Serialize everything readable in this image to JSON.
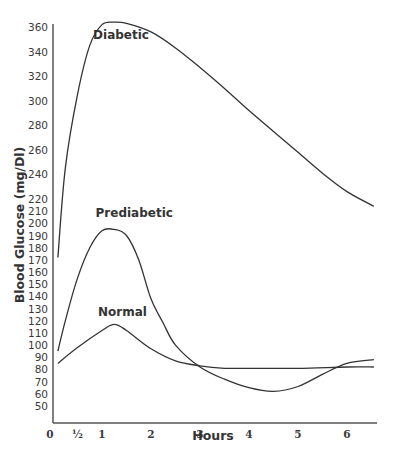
{
  "chart_data": {
    "type": "line",
    "title": "",
    "xlabel": "Hours",
    "ylabel": "Blood Glucose (mg/Dl)",
    "x_ticks": [
      "0",
      "½",
      "1",
      "2",
      "3",
      "4",
      "5",
      "6"
    ],
    "x_tick_values": [
      0,
      0.5,
      1,
      2,
      3,
      4,
      5,
      6
    ],
    "y_ticks": [
      360,
      340,
      320,
      300,
      280,
      260,
      240,
      220,
      210,
      200,
      190,
      180,
      170,
      160,
      150,
      140,
      130,
      120,
      110,
      100,
      90,
      80,
      70,
      60,
      50
    ],
    "xlim": [
      0,
      6.6
    ],
    "ylim": [
      50,
      365
    ],
    "grid": false,
    "legend": "inline labels",
    "series": [
      {
        "name": "Diabetic",
        "label_pos": {
          "x": 0.9,
          "y": 350
        },
        "x": [
          0.1,
          0.25,
          0.5,
          0.75,
          1.0,
          1.25,
          1.5,
          2.0,
          2.5,
          3.0,
          3.5,
          4.0,
          4.5,
          5.0,
          5.5,
          6.0,
          6.55
        ],
        "values": [
          172,
          245,
          305,
          345,
          362,
          364,
          363,
          356,
          343,
          327,
          310,
          292,
          275,
          258,
          241,
          226,
          214
        ]
      },
      {
        "name": "Prediabetic",
        "label_pos": {
          "x": 0.95,
          "y": 205
        },
        "x": [
          0.1,
          0.25,
          0.5,
          0.75,
          1.0,
          1.25,
          1.5,
          1.75,
          2.0,
          2.25,
          2.5,
          3.0,
          3.5,
          4.0,
          4.5,
          5.0,
          5.5,
          6.0,
          6.55
        ],
        "values": [
          95,
          120,
          155,
          180,
          194,
          195,
          190,
          170,
          138,
          118,
          100,
          82,
          72,
          65,
          62,
          66,
          76,
          85,
          88
        ]
      },
      {
        "name": "Normal",
        "label_pos": {
          "x": 1.0,
          "y": 124
        },
        "x": [
          0.1,
          0.5,
          1.0,
          1.25,
          1.5,
          2.0,
          2.5,
          3.0,
          3.5,
          4.0,
          5.0,
          6.0,
          6.55
        ],
        "values": [
          85,
          98,
          112,
          117,
          112,
          97,
          87,
          83,
          81,
          81,
          81,
          82,
          82
        ]
      }
    ]
  }
}
